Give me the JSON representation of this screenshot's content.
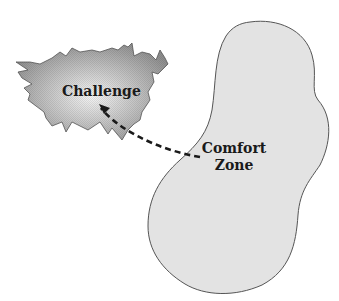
{
  "diagram": {
    "type": "concept-diagram",
    "nodes": [
      {
        "id": "challenge",
        "label": "Challenge",
        "shape": "jagged-blob",
        "fill": "#a8a8a8"
      },
      {
        "id": "comfort_zone",
        "label_line1": "Comfort",
        "label_line2": "Zone",
        "shape": "rounded-blob",
        "fill": "#e2e2e2"
      }
    ],
    "edges": [
      {
        "from": "comfort_zone",
        "to": "challenge",
        "style": "dashed",
        "arrow": "end"
      }
    ],
    "colors": {
      "challenge_fill": "#a8a8a8",
      "challenge_highlight": "#f2f2f2",
      "comfort_fill": "#e2e2e2",
      "outline": "#555555",
      "arrow": "#1a1a1a",
      "text": "#1a1a1a"
    }
  },
  "labels": {
    "challenge": "Challenge",
    "comfort_line1": "Comfort",
    "comfort_line2": "Zone"
  }
}
